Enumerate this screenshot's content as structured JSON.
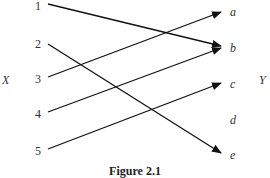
{
  "diagram": {
    "domain_set_label": "X",
    "codomain_set_label": "Y",
    "domain": [
      "1",
      "2",
      "3",
      "4",
      "5"
    ],
    "codomain": [
      "a",
      "b",
      "c",
      "d",
      "e"
    ],
    "mappings": [
      {
        "from": "1",
        "to": "b"
      },
      {
        "from": "2",
        "to": "e"
      },
      {
        "from": "3",
        "to": "a"
      },
      {
        "from": "4",
        "to": "b"
      },
      {
        "from": "5",
        "to": "c"
      }
    ],
    "caption": "Figure 2.1"
  }
}
